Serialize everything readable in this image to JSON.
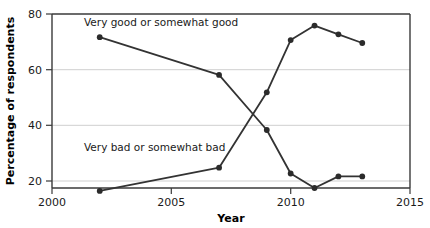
{
  "chart_data": {
    "type": "line",
    "title": "",
    "xlabel": "Year",
    "ylabel": "Percentage of respondents",
    "xlim": [
      2000,
      2015
    ],
    "ylim": [
      20,
      80
    ],
    "xticks": [
      2000,
      2005,
      2010,
      2015
    ],
    "yticks": [
      20,
      40,
      60,
      80
    ],
    "xtick_labels": [
      "2000",
      "2005",
      "2010",
      "2015"
    ],
    "ytick_labels": [
      "20",
      "40",
      "60",
      "80"
    ],
    "grid": "horizontal",
    "legend_position": "inline-annotations",
    "marker": "circle",
    "line_color": "#333333",
    "series": [
      {
        "name": "Very good or somewhat good",
        "annotation": "Very good or somewhat good",
        "x": [
          2002,
          2007,
          2009,
          2010,
          2011,
          2012,
          2013
        ],
        "values": [
          72,
          59,
          40,
          25,
          20,
          24,
          24
        ]
      },
      {
        "name": "Very bad or somewhat bad",
        "annotation": "Very bad or somewhat bad",
        "x": [
          2002,
          2007,
          2009,
          2010,
          2011,
          2012,
          2013
        ],
        "values": [
          19,
          27,
          53,
          71,
          76,
          73,
          70
        ]
      }
    ]
  },
  "axis": {
    "x_title": "Year",
    "y_title": "Percentage of respondents"
  },
  "annotations": {
    "good_label": "Very good or somewhat good",
    "bad_label": "Very bad or somewhat bad"
  },
  "colors": {
    "line": "#333333",
    "marker": "#2b2b2b",
    "grid": "#cfcfcf",
    "frame": "#3a3a3a",
    "background": "#ffffff"
  }
}
